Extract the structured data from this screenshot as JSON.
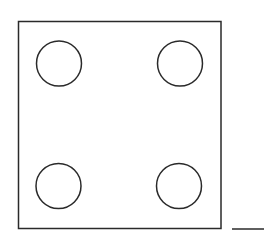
{
  "diagram": {
    "stroke_color": "#2a2a2a",
    "background": "#ffffff",
    "square": {
      "x": 18.5,
      "y": 21.5,
      "width": 202.5,
      "height": 207
    },
    "circles": [
      {
        "position": "top-left",
        "cx": 59,
        "cy": 63.5,
        "r": 22.5
      },
      {
        "position": "top-right",
        "cx": 180,
        "cy": 63.5,
        "r": 22.5
      },
      {
        "position": "bottom-left",
        "cx": 58.5,
        "cy": 186,
        "r": 22.5
      },
      {
        "position": "bottom-right",
        "cx": 179,
        "cy": 186,
        "r": 22.5
      }
    ],
    "baseline": {
      "x1": 232,
      "y1": 229,
      "x2": 264,
      "y2": 229
    }
  }
}
